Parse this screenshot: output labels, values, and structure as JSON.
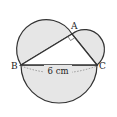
{
  "diagram": {
    "points": {
      "A": {
        "label": "A",
        "x": 72,
        "y": 34
      },
      "B": {
        "label": "B",
        "x": 21,
        "y": 65
      },
      "C": {
        "label": "C",
        "x": 97,
        "y": 65
      }
    },
    "bc_label": "6 cm",
    "right_angle_at": "A",
    "fill_color": "#e6e6e6",
    "stroke_color": "#333333"
  }
}
